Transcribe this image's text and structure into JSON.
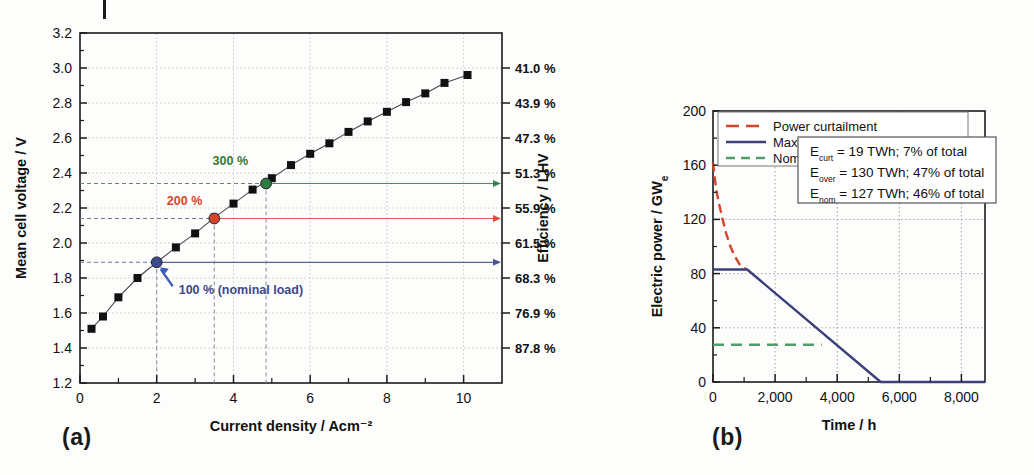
{
  "figure": {
    "panel_a_label": "(a)",
    "panel_b_label": "(b)"
  },
  "panel_a": {
    "ylabel": "Mean cell voltage / V",
    "xlabel": "Current density / Acm⁻²",
    "ylabel_right": "Efficiency / LHV",
    "y_ticks": [
      "1.2",
      "1.4",
      "1.6",
      "1.8",
      "2.0",
      "2.2",
      "2.4",
      "2.6",
      "2.8",
      "3.0",
      "3.2"
    ],
    "x_ticks": [
      "0",
      "2",
      "4",
      "6",
      "8",
      "10"
    ],
    "efficiency_ticks": [
      "87.8 %",
      "76.9 %",
      "68.3 %",
      "61.5 %",
      "55.9 %",
      "51.3 %",
      "47.3 %",
      "43.9 %",
      "41.0 %"
    ],
    "annotations": [
      {
        "id": "load-100",
        "label": "100 %",
        "suffix": " (nominal load)",
        "color": "#3b4a8c",
        "x": 2.0,
        "y": 1.89
      },
      {
        "id": "load-200",
        "label": "200 %",
        "suffix": "",
        "color": "#d4452a",
        "x": 3.5,
        "y": 2.14
      },
      {
        "id": "load-300",
        "label": "300 %",
        "suffix": "",
        "color": "#2f7a3f",
        "x": 4.85,
        "y": 2.34
      }
    ],
    "colors": {
      "curve": "#4a4a4a",
      "marker": "#111111",
      "blue": "#4a5a9e",
      "red": "#d4452a",
      "green": "#5a9e6a",
      "grid": "#c8c8c8",
      "axis": "#1b1b1b"
    }
  },
  "panel_b": {
    "ylabel": "Electric power / GW",
    "ylabel_sub": "e",
    "xlabel": "Time / h",
    "y_ticks": [
      "0",
      "40",
      "80",
      "120",
      "160",
      "200"
    ],
    "x_ticks": [
      "0",
      "2,000",
      "4,000",
      "6,000",
      "8,000"
    ],
    "legend": [
      {
        "label": "Power curtailment",
        "style": "dashed",
        "color": "#d4452a"
      },
      {
        "label": "Maximum electrolysis power",
        "style": "solid",
        "color": "#3b3f7a"
      },
      {
        "label": "Nominal electrolysis power",
        "style": "dashed",
        "color": "#4f9e68"
      }
    ],
    "energy_box": [
      {
        "sym": "E",
        "sub": "curt",
        "text": " = 19 TWh; 7% of total"
      },
      {
        "sym": "E",
        "sub": "over",
        "text": " = 130 TWh; 47% of total"
      },
      {
        "sym": "E",
        "sub": "nom",
        "text": " = 127 TWh; 46% of total"
      }
    ],
    "colors": {
      "curtailment": "#d4452a",
      "maximum": "#3b3f7a",
      "nominal": "#4f9e68",
      "grid": "#9a9a9a",
      "axis": "#1b1b1b"
    }
  },
  "chart_data": [
    {
      "type": "line",
      "panel": "a",
      "title": "",
      "xlabel": "Current density / Acm-2",
      "ylabel": "Mean cell voltage / V",
      "ylabel_secondary": "Efficiency / LHV",
      "xlim": [
        0,
        11
      ],
      "ylim": [
        1.2,
        3.2
      ],
      "grid": true,
      "legend": "none",
      "series": [
        {
          "name": "Polarisation curve",
          "marker": "square",
          "x": [
            0.3,
            0.6,
            1.0,
            1.5,
            2.0,
            2.5,
            3.0,
            3.5,
            4.0,
            4.5,
            5.0,
            5.5,
            6.0,
            6.5,
            7.0,
            7.5,
            8.0,
            8.5,
            9.0,
            9.5,
            10.1
          ],
          "y": [
            1.51,
            1.58,
            1.69,
            1.8,
            1.89,
            1.975,
            2.055,
            2.145,
            2.225,
            2.305,
            2.37,
            2.445,
            2.51,
            2.57,
            2.635,
            2.695,
            2.75,
            2.805,
            2.855,
            2.915,
            2.96
          ]
        }
      ],
      "secondary_axis": {
        "label": "Efficiency / LHV",
        "ticks_voltage": [
          3.0,
          2.8,
          2.6,
          2.4,
          2.2,
          2.0,
          1.8,
          1.6,
          1.4
        ],
        "ticks_label": [
          "41.0 %",
          "43.9 %",
          "47.3 %",
          "51.3 %",
          "55.9 %",
          "61.5 %",
          "68.3 %",
          "76.9 %",
          "87.8 %"
        ]
      },
      "annotations": [
        {
          "label": "100 % (nominal load)",
          "x": 2.0,
          "y": 1.89,
          "color": "#3b4a8c"
        },
        {
          "label": "200 %",
          "x": 3.5,
          "y": 2.14,
          "color": "#d4452a"
        },
        {
          "label": "300 %",
          "x": 4.85,
          "y": 2.34,
          "color": "#2f7a3f"
        }
      ]
    },
    {
      "type": "line",
      "panel": "b",
      "title": "",
      "xlabel": "Time / h",
      "ylabel": "Electric power / GWe",
      "xlim": [
        0,
        8760
      ],
      "ylim": [
        0,
        200
      ],
      "grid": true,
      "legend": "upper-left",
      "series": [
        {
          "name": "Power curtailment",
          "style": "dashed",
          "color": "#d4452a",
          "x": [
            0,
            60,
            120,
            200,
            300,
            420,
            560,
            700,
            850,
            1000,
            1100
          ],
          "y": [
            162,
            150,
            140,
            131,
            121,
            110,
            100,
            93,
            87,
            84,
            83
          ]
        },
        {
          "name": "Maximum electrolysis power",
          "style": "solid",
          "color": "#3b3f7a",
          "x": [
            0,
            1100,
            5400,
            8760
          ],
          "y": [
            83,
            83,
            0,
            0
          ]
        },
        {
          "name": "Nominal electrolysis power",
          "style": "dashed",
          "color": "#4f9e68",
          "x": [
            0,
            3500
          ],
          "y": [
            27.5,
            27.5
          ]
        }
      ],
      "annotations": [
        {
          "label": "Ecurt = 19 TWh; 7% of total"
        },
        {
          "label": "Eover = 130 TWh; 47% of total"
        },
        {
          "label": "Enom = 127 TWh; 46% of total"
        }
      ]
    }
  ]
}
